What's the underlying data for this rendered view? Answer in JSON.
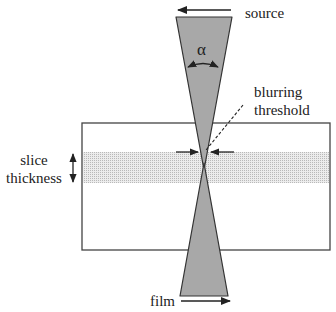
{
  "diagram": {
    "type": "tomography geometry",
    "labels": {
      "source": "source",
      "film": "film",
      "alpha": "α",
      "blurring_threshold_line1": "blurring",
      "blurring_threshold_line2": "threshold",
      "slice_thickness_line1": "slice",
      "slice_thickness_line2": "thickness"
    },
    "colors": {
      "cone_fill": "#a8a8a8",
      "slice_band": "#d9d9d9",
      "stroke": "#333333",
      "background": "#ffffff"
    },
    "arrows": {
      "source_direction": "left",
      "film_direction": "right",
      "slice_thickness": "double-vertical"
    }
  }
}
